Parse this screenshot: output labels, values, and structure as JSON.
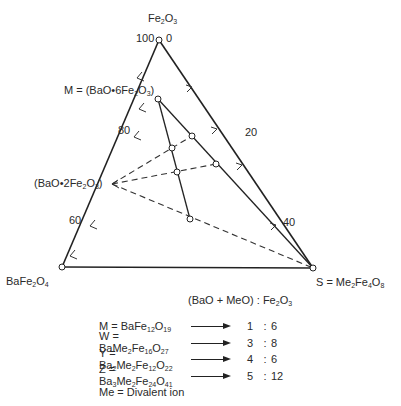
{
  "diagram": {
    "type": "ternary-phase-diagram",
    "vertices": {
      "top": "Fe2O3",
      "left": "BaFe2O4",
      "right": "S = Me2Fe4O8"
    },
    "labels": {
      "top_html": "Fe<sub>2</sub>O<sub>3</sub>",
      "left_html": "BaFe<sub>2</sub>O<sub>4</sub>",
      "right_html": "S = Me<sub>2</sub>Fe<sub>4</sub>O<sub>8</sub>",
      "m_point_html": "M = (BaO•6Fe<sub>2</sub>O<sub>3</sub>)",
      "bao2_point_html": "(BaO•2Fe<sub>2</sub>O<sub>3</sub>)"
    },
    "left_axis_ticks": [
      "100",
      "80",
      "60"
    ],
    "right_axis_ticks": [
      "0",
      "20",
      "40"
    ]
  },
  "legend": {
    "header_html": "(BaO + MeO) : Fe<sub>2</sub>O<sub>3</sub>",
    "rows": [
      {
        "formula_html": "M = BaFe<sub>12</sub>O<sub>19</sub>",
        "a": "1",
        "b": "6"
      },
      {
        "formula_html": "W = BaMe<sub>2</sub>Fe<sub>16</sub>O<sub>27</sub>",
        "a": "3",
        "b": "8"
      },
      {
        "formula_html": "Y = Ba<sub>2</sub>Me<sub>2</sub>Fe<sub>12</sub>O<sub>22</sub>",
        "a": "4",
        "b": "6"
      },
      {
        "formula_html": "Z = Ba<sub>3</sub>Me<sub>2</sub>Fe<sub>24</sub>O<sub>41</sub>",
        "a": "5",
        "b": "12"
      }
    ],
    "note": "Me = Divalent ion",
    "separator": ":"
  }
}
